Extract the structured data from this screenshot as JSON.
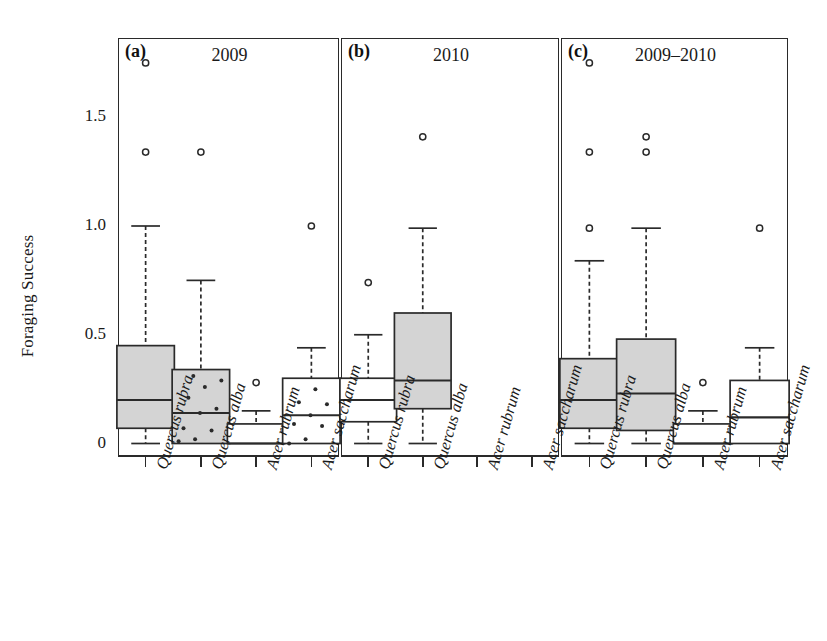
{
  "figure": {
    "ylabel": "Foraging Success",
    "y_ticks": [
      "0",
      "0.5",
      "1.0",
      "1.5"
    ]
  },
  "panels": [
    {
      "tag": "(a)",
      "title": "2009"
    },
    {
      "tag": "(b)",
      "title": "2010"
    },
    {
      "tag": "(c)",
      "title": "2009–2010"
    }
  ],
  "categories": [
    "Quercus rubra",
    "Quercus alba",
    "Acer rubrum",
    "Acer saccharum"
  ],
  "chart_data": {
    "type": "box",
    "title": "",
    "xlabel": "",
    "ylabel": "Foraging Success",
    "ylim": [
      0,
      1.8
    ],
    "yticks": [
      0,
      0.5,
      1.0,
      1.5
    ],
    "ytick_labels": [
      "0",
      "0.5",
      "1.0",
      "1.5"
    ],
    "grid": false,
    "legend": "none",
    "categories": [
      "Quercus rubra",
      "Quercus alba",
      "Acer rubrum",
      "Acer saccharum"
    ],
    "panels": [
      {
        "tag": "(a)",
        "title": "2009",
        "boxes": [
          {
            "category": "Quercus rubra",
            "filled": true,
            "whisker_low": 0.0,
            "q1": 0.07,
            "median": 0.2,
            "q3": 0.45,
            "whisker_high": 1.0,
            "outliers": [
              1.34,
              1.75
            ],
            "points": []
          },
          {
            "category": "Quercus alba",
            "filled": true,
            "whisker_low": 0.0,
            "q1": 0.0,
            "median": 0.14,
            "q3": 0.34,
            "whisker_high": 0.75,
            "outliers": [
              1.34
            ],
            "points": [
              0.01,
              0.02,
              0.06,
              0.07,
              0.14,
              0.16,
              0.21,
              0.26,
              0.29,
              0.31
            ]
          },
          {
            "category": "Acer rubrum",
            "filled": false,
            "whisker_low": 0.0,
            "q1": 0.0,
            "median": 0.0,
            "q3": 0.09,
            "whisker_high": 0.15,
            "outliers": [
              0.28
            ],
            "points": []
          },
          {
            "category": "Acer saccharum",
            "filled": false,
            "whisker_low": 0.0,
            "q1": 0.0,
            "median": 0.13,
            "q3": 0.3,
            "whisker_high": 0.44,
            "outliers": [
              1.0
            ],
            "points": [
              0.0,
              0.02,
              0.08,
              0.09,
              0.13,
              0.18,
              0.19,
              0.25
            ]
          }
        ]
      },
      {
        "tag": "(b)",
        "title": "2010",
        "boxes": [
          {
            "category": "Quercus rubra",
            "filled": false,
            "whisker_low": 0.0,
            "q1": 0.1,
            "median": 0.2,
            "q3": 0.3,
            "whisker_high": 0.5,
            "outliers": [
              0.74
            ],
            "points": []
          },
          {
            "category": "Quercus alba",
            "filled": true,
            "whisker_low": 0.0,
            "q1": 0.16,
            "median": 0.29,
            "q3": 0.6,
            "whisker_high": 0.99,
            "outliers": [
              1.41
            ],
            "points": []
          },
          {
            "category": "Acer rubrum",
            "filled": false,
            "empty": true,
            "points": [],
            "outliers": []
          },
          {
            "category": "Acer saccharum",
            "filled": false,
            "empty": true,
            "points": [],
            "outliers": []
          }
        ]
      },
      {
        "tag": "(c)",
        "title": "2009–2010",
        "boxes": [
          {
            "category": "Quercus rubra",
            "filled": true,
            "whisker_low": 0.0,
            "q1": 0.07,
            "median": 0.2,
            "q3": 0.39,
            "whisker_high": 0.84,
            "outliers": [
              0.99,
              1.34,
              1.75
            ],
            "points": []
          },
          {
            "category": "Quercus alba",
            "filled": true,
            "whisker_low": 0.0,
            "q1": 0.06,
            "median": 0.23,
            "q3": 0.48,
            "whisker_high": 0.99,
            "outliers": [
              1.34,
              1.41
            ],
            "points": []
          },
          {
            "category": "Acer rubrum",
            "filled": false,
            "whisker_low": 0.0,
            "q1": 0.0,
            "median": 0.0,
            "q3": 0.09,
            "whisker_high": 0.15,
            "outliers": [
              0.28
            ],
            "points": []
          },
          {
            "category": "Acer saccharum",
            "filled": false,
            "whisker_low": 0.0,
            "q1": 0.0,
            "median": 0.12,
            "q3": 0.29,
            "whisker_high": 0.44,
            "outliers": [
              0.99
            ],
            "points": []
          }
        ]
      }
    ]
  },
  "style": {
    "box_fill": "#d4d4d4",
    "box_empty_fill": "#ffffff",
    "line_color": "#2a2a2a",
    "text_color": "#1a1a1a"
  }
}
